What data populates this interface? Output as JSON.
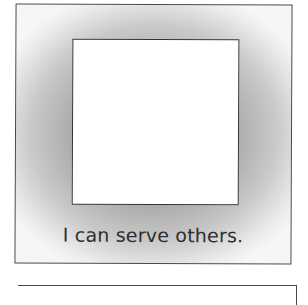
{
  "cards": [
    {
      "picture_area": "blank",
      "caption": "I can serve others."
    }
  ],
  "next_card": {
    "partially_visible": true
  },
  "colors": {
    "border": "#4a4a4a",
    "shading": "#9a9a9a",
    "text": "#2e2e2e",
    "frame_fill": "#ffffff"
  }
}
